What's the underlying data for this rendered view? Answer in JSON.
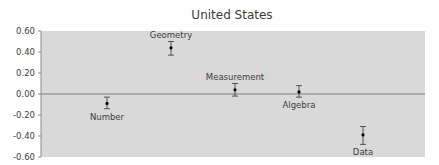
{
  "chart_data": {
    "type": "scatter",
    "title": "United States",
    "xlabel": "",
    "ylabel": "",
    "ylim": [
      -0.6,
      0.6
    ],
    "yticks": [
      "0.60",
      "0.40",
      "0.20",
      "0.00",
      "-0.20",
      "-0.40",
      "-0.60"
    ],
    "grid": false,
    "legend": null,
    "reference_line": 0.0,
    "categories": [
      "Number",
      "Geometry",
      "Measurement",
      "Algebra",
      "Data"
    ],
    "values": [
      -0.09,
      0.44,
      0.04,
      0.02,
      -0.39
    ],
    "error_low": [
      -0.14,
      0.37,
      -0.02,
      -0.03,
      -0.48
    ],
    "error_high": [
      -0.03,
      0.5,
      0.1,
      0.08,
      -0.31
    ],
    "label_position": [
      "below",
      "above",
      "above",
      "below",
      "below"
    ]
  },
  "colors": {
    "plot_background": "#d9d9d9",
    "zero_line": "#7f7f7f",
    "axis": "#8c8c8c",
    "point": "#000000"
  }
}
